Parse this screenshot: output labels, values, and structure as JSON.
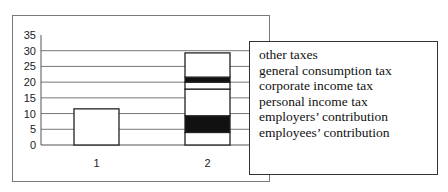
{
  "chart_data": {
    "type": "bar",
    "stacked": true,
    "title": "",
    "xlabel": "",
    "ylabel": "",
    "ylim": [
      0,
      35
    ],
    "yticks": [
      0,
      5,
      10,
      15,
      20,
      25,
      30,
      35
    ],
    "grid": true,
    "legend_position": "right",
    "categories": [
      "1",
      "2"
    ],
    "series": [
      {
        "name": "employees' contribution",
        "fill": "#ffffff",
        "values": [
          11.5,
          4.0
        ]
      },
      {
        "name": "employers' contribution",
        "fill": "#111111",
        "values": [
          0,
          5.3
        ]
      },
      {
        "name": "personal income tax",
        "fill": "#ffffff",
        "values": [
          0,
          8.5
        ]
      },
      {
        "name": "corporate income tax",
        "fill": "#ffffff",
        "values": [
          0,
          2.2
        ]
      },
      {
        "name": "general consumption tax",
        "fill": "#111111",
        "values": [
          0,
          1.6
        ]
      },
      {
        "name": "other taxes",
        "fill": "#ffffff",
        "values": [
          0,
          7.7
        ]
      }
    ],
    "totals": [
      11.5,
      29.3
    ]
  },
  "legend": {
    "items": [
      "other taxes",
      "general consumption tax",
      "corporate income tax",
      "personal income tax",
      "employers’ contribution",
      "employees’ contribution"
    ]
  },
  "axis": {
    "y_labels": [
      "35",
      "30",
      "25",
      "20",
      "15",
      "10",
      "5",
      "0"
    ],
    "x_labels": [
      "1",
      "2"
    ]
  }
}
